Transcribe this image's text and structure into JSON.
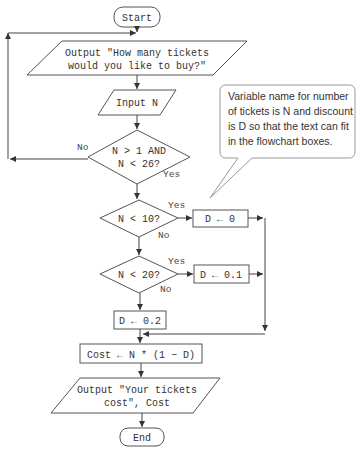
{
  "flowchart": {
    "start": "Start",
    "output_prompt": [
      "Output \"How many tickets",
      "would you like to buy?\""
    ],
    "input": "Input N",
    "validate": {
      "lines": [
        "N > 1 AND",
        "N < 26?"
      ],
      "no_label": "No",
      "yes_label": "Yes"
    },
    "check_10": {
      "text": "N < 10?",
      "yes_label": "Yes",
      "no_label": "No"
    },
    "assign_0": "D ← 0",
    "check_20": {
      "text": "N < 20?",
      "yes_label": "Yes",
      "no_label": "No"
    },
    "assign_01": "D ← 0.1",
    "assign_02": "D ← 0.2",
    "cost": "Cost ← N * (1 − D)",
    "output_cost": [
      "Output \"Your tickets",
      "cost\", Cost"
    ],
    "end": "End"
  },
  "callout": {
    "lines": [
      "Variable name for number",
      "of tickets is N and discount",
      "is D so that the text can fit",
      "in the flowchart boxes."
    ]
  }
}
